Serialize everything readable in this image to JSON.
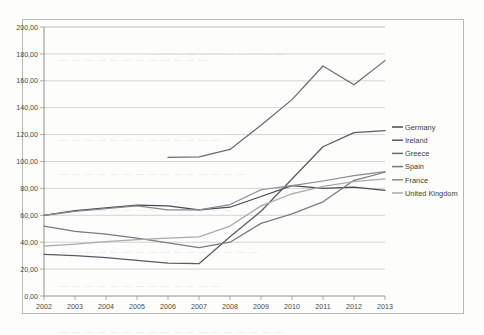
{
  "chart_data": {
    "type": "line",
    "title": "",
    "subtitle": "",
    "xlabel": "",
    "ylabel": "",
    "x": [
      2002,
      2003,
      2004,
      2005,
      2006,
      2007,
      2008,
      2009,
      2010,
      2011,
      2012,
      2013
    ],
    "xtick_labels": [
      "2002",
      "2003",
      "2004",
      "2005",
      "2006",
      "2007",
      "2008",
      "2009",
      "2010",
      "2011",
      "2012",
      "2013"
    ],
    "ytick_labels": [
      "0,00",
      "20,00",
      "40,00",
      "60,00",
      "80,00",
      "100,00",
      "120,00",
      "140,00",
      "160,00",
      "180,00",
      "200,00"
    ],
    "ytick_values": [
      0,
      20,
      40,
      60,
      80,
      100,
      120,
      140,
      160,
      180,
      200
    ],
    "ylim": [
      0,
      200
    ],
    "xlim": [
      2002,
      2013
    ],
    "grid": "horizontal",
    "legend_position": "right",
    "decimal_separator": ",",
    "series": [
      {
        "name": "Germany",
        "color": "#4a4a52",
        "x": [
          2002,
          2003,
          2004,
          2005,
          2006,
          2007,
          2008,
          2009,
          2010,
          2011,
          2012,
          2013
        ],
        "values": [
          60.0,
          63.5,
          65.5,
          67.5,
          67.0,
          64.0,
          66.0,
          74.0,
          82.0,
          80.0,
          81.0,
          78.5
        ]
      },
      {
        "name": "Ireland",
        "color": "#5a5a62",
        "x": [
          2002,
          2003,
          2004,
          2005,
          2006,
          2007,
          2008,
          2009,
          2010,
          2011,
          2012,
          2013
        ],
        "values": [
          31.0,
          30.0,
          28.5,
          26.5,
          24.5,
          24.0,
          44.0,
          63.0,
          87.0,
          111.0,
          121.5,
          123.0
        ]
      },
      {
        "name": "Greece",
        "color": "#6b6b72",
        "x": [
          2006,
          2007,
          2008,
          2009,
          2010,
          2011,
          2012,
          2013
        ],
        "values": [
          103.0,
          103.5,
          109.0,
          127.0,
          146.0,
          171.0,
          157.0,
          175.0
        ]
      },
      {
        "name": "Spain",
        "color": "#7a7a80",
        "x": [
          2002,
          2003,
          2004,
          2005,
          2006,
          2007,
          2008,
          2009,
          2010,
          2011,
          2012,
          2013
        ],
        "values": [
          52.0,
          48.0,
          46.0,
          43.0,
          39.5,
          36.0,
          40.0,
          54.0,
          61.0,
          70.0,
          86.0,
          92.0
        ]
      },
      {
        "name": "France",
        "color": "#8a8a90",
        "x": [
          2002,
          2003,
          2004,
          2005,
          2006,
          2007,
          2008,
          2009,
          2010,
          2011,
          2012,
          2013
        ],
        "values": [
          60.0,
          63.0,
          65.0,
          67.0,
          64.0,
          64.0,
          68.0,
          79.0,
          82.0,
          85.5,
          89.5,
          92.5
        ]
      },
      {
        "name": "United Kingdom",
        "color": "#a9a9ae",
        "x": [
          2002,
          2003,
          2004,
          2005,
          2006,
          2007,
          2008,
          2009,
          2010,
          2011,
          2012,
          2013
        ],
        "values": [
          37.0,
          38.5,
          40.5,
          42.0,
          43.0,
          44.0,
          52.0,
          67.0,
          76.0,
          81.5,
          85.0,
          87.0
        ]
      }
    ]
  },
  "legend": {
    "items": [
      {
        "label": "Germany"
      },
      {
        "label": "Ireland"
      },
      {
        "label": "Greece"
      },
      {
        "label": "Spain"
      },
      {
        "label": "France"
      },
      {
        "label": "United Kingdom"
      }
    ]
  },
  "background_text": [
    "ORIG",
    "a is on",
    "the dat",
    "so tha",
    "t the",
    "at the",
    "a ba",
    "mar",
    "cont",
    "dis",
    "tion",
    "rep",
    "on"
  ]
}
